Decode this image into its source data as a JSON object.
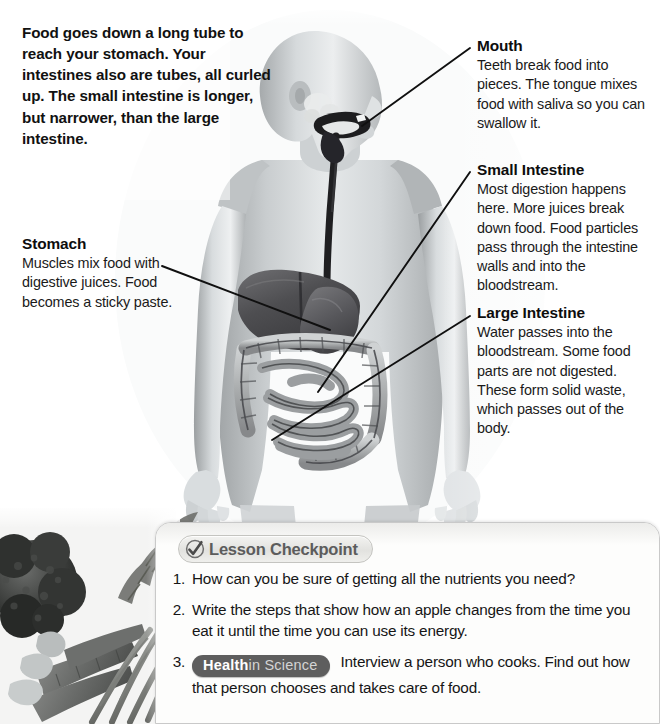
{
  "intro": {
    "text": "Food goes down a long tube to reach your stomach. Your intestines also are tubes, all curled up. The small intestine is longer, but narrower, than the large intestine."
  },
  "callouts": [
    {
      "id": "mouth",
      "title": "Mouth",
      "body": "Teeth break food into pieces. The tongue mixes food with saliva so you can swallow it."
    },
    {
      "id": "small-intestine",
      "title": "Small Intestine",
      "body": "Most digestion happens here. More juices break down food. Food particles pass through the intestine walls and into the bloodstream."
    },
    {
      "id": "large-intestine",
      "title": "Large Intestine",
      "body": "Water passes into the bloodstream. Some food parts are not digested. These form solid waste, which passes out of the body."
    },
    {
      "id": "stomach",
      "title": "Stomach",
      "body": "Muscles mix food with digestive juices. Food becomes a sticky paste."
    }
  ],
  "checkpoint": {
    "badge_label": "Lesson Checkpoint",
    "badge_icon": "check-mark-icon",
    "questions": [
      {
        "number": "1.",
        "text": "How can you be sure of getting all the nutrients you need?"
      },
      {
        "number": "2.",
        "text": "Write the steps that show how an apple changes from the time you eat it until the time you can use its energy."
      },
      {
        "number": "3.",
        "pill_strong": "Health",
        "pill_light": "in Science",
        "text": "Interview a person who cooks. Find out how that person chooses and takes care of food."
      }
    ]
  },
  "illustration": {
    "subject": "human-digestive-system-figure",
    "photo_bottom_left": "broccoli-and-carrots-photo",
    "organs": [
      "mouth",
      "esophagus",
      "liver",
      "stomach",
      "small-intestine",
      "large-intestine"
    ]
  },
  "colors": {
    "page_background": "#ffffff",
    "text": "#111111",
    "badge_text": "#5c5c5c",
    "health_pill_background": "#5e5e5e",
    "leader_line": "#101010"
  }
}
